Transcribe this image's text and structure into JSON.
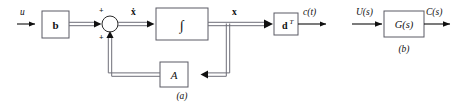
{
  "figure": {
    "background_color": "#ffffff",
    "line_color": "#101010",
    "vector_line_color": "#6e6e78",
    "box_stroke_color": "#5a5a64",
    "panels": [
      {
        "id": "a",
        "caption": "(a)",
        "description": "state-variable block diagram"
      },
      {
        "id": "b",
        "caption": "(b)",
        "description": "transfer-function block diagram"
      }
    ]
  },
  "panel_a": {
    "caption": "(a)",
    "input_label": "u",
    "blocks": [
      {
        "key": "b",
        "label": "b",
        "style": "bold"
      },
      {
        "key": "integrator",
        "label": "∫",
        "style": "italic"
      },
      {
        "key": "dT",
        "label": "d",
        "superscript": "T",
        "style": "bold"
      },
      {
        "key": "A",
        "label": "A",
        "style": "italic"
      }
    ],
    "summing_junction": {
      "sign_top": "+",
      "sign_bottom": "+"
    },
    "signals": [
      {
        "key": "u",
        "label": "u",
        "type": "scalar"
      },
      {
        "key": "xdot",
        "label": "ẋ",
        "type": "vector"
      },
      {
        "key": "x",
        "label": "x",
        "type": "vector"
      },
      {
        "key": "ct",
        "label": "c(t)",
        "type": "scalar"
      }
    ]
  },
  "panel_b": {
    "caption": "(b)",
    "input_label": "U(s)",
    "output_label": "C(s)",
    "block_label": "G(s)"
  }
}
